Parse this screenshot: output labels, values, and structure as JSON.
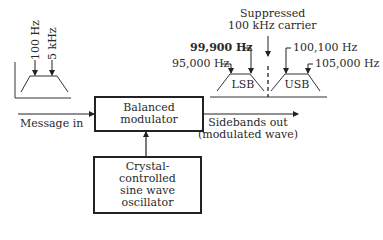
{
  "diagram": {
    "input_spectrum": {
      "labels": [
        "100 Hz",
        "5 kHz"
      ]
    },
    "output_spectrum": {
      "carrier_label_line1": "Suppressed",
      "carrier_label_line2": "100 kHz carrier",
      "lsb_label": "LSB",
      "usb_label": "USB",
      "lsb_inner_freq": "99,900 Hz",
      "lsb_outer_freq": "95,000 Hz",
      "usb_inner_freq": "100,100 Hz",
      "usb_outer_freq": "105,000 Hz"
    },
    "blocks": {
      "modulator_line1": "Balanced",
      "modulator_line2": "modulator",
      "oscillator_line1": "Crystal-",
      "oscillator_line2": "controlled",
      "oscillator_line3": "sine wave",
      "oscillator_line4": "oscillator"
    },
    "signals": {
      "input_label": "Message in",
      "output_label_line1": "Sidebands out",
      "output_label_line2": "(modulated wave)"
    }
  }
}
